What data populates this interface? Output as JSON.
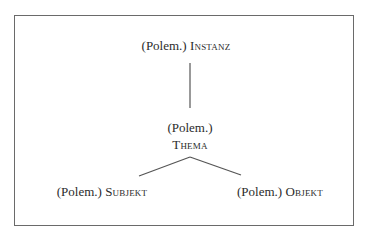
{
  "diagram": {
    "frame_color": "#6a6a6a",
    "line_color": "#555555",
    "nodes": {
      "instanz": {
        "prefix": "(Polem.)",
        "term": "Instanz"
      },
      "thema": {
        "prefix": "(Polem.)",
        "term": "Thema"
      },
      "subjekt": {
        "prefix": "(Polem.)",
        "term": "Subjekt"
      },
      "objekt": {
        "prefix": "(Polem.)",
        "term": "Objekt"
      }
    },
    "edges": [
      {
        "from": "instanz",
        "to": "thema"
      },
      {
        "from": "thema",
        "to": "subjekt"
      },
      {
        "from": "thema",
        "to": "objekt"
      }
    ]
  }
}
